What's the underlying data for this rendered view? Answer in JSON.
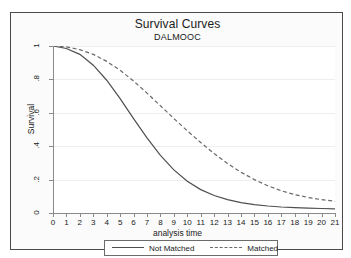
{
  "chart_data": {
    "type": "line",
    "title": "Survival Curves",
    "subtitle": "DALMOOC",
    "xlabel": "analysis time",
    "ylabel": "Survival",
    "xlim": [
      0,
      21
    ],
    "ylim": [
      0,
      1
    ],
    "grid": true,
    "legend_position": "bottom",
    "xticks": [
      "0",
      "1",
      "2",
      "3",
      "4",
      "5",
      "6",
      "7",
      "8",
      "9",
      "10",
      "11",
      "12",
      "13",
      "14",
      "15",
      "16",
      "17",
      "18",
      "19",
      "20",
      "21"
    ],
    "xtick_values": [
      0,
      1,
      2,
      3,
      4,
      5,
      6,
      7,
      8,
      9,
      10,
      11,
      12,
      13,
      14,
      15,
      16,
      17,
      18,
      19,
      20,
      21
    ],
    "yticks": [
      "0",
      ".2",
      ".4",
      ".6",
      ".8",
      "1"
    ],
    "ytick_values": [
      0,
      0.2,
      0.4,
      0.6,
      0.8,
      1
    ],
    "x": [
      0,
      1,
      2,
      3,
      4,
      5,
      6,
      7,
      8,
      9,
      10,
      11,
      12,
      13,
      14,
      15,
      16,
      17,
      18,
      19,
      20,
      21
    ],
    "series": [
      {
        "name": "Not Matched",
        "style": "solid",
        "color": "#4f4f4f",
        "values": [
          1.0,
          0.985,
          0.95,
          0.885,
          0.795,
          0.685,
          0.565,
          0.45,
          0.345,
          0.258,
          0.19,
          0.14,
          0.105,
          0.08,
          0.062,
          0.05,
          0.042,
          0.036,
          0.032,
          0.029,
          0.027,
          0.025
        ]
      },
      {
        "name": "Matched",
        "style": "dashed",
        "color": "#6a6a6a",
        "values": [
          1.0,
          0.995,
          0.978,
          0.95,
          0.908,
          0.855,
          0.79,
          0.718,
          0.642,
          0.566,
          0.492,
          0.422,
          0.356,
          0.296,
          0.244,
          0.2,
          0.163,
          0.133,
          0.11,
          0.093,
          0.08,
          0.07
        ]
      }
    ]
  },
  "legend": {
    "entries": [
      {
        "label": "Not Matched"
      },
      {
        "label": "Matched"
      }
    ]
  }
}
